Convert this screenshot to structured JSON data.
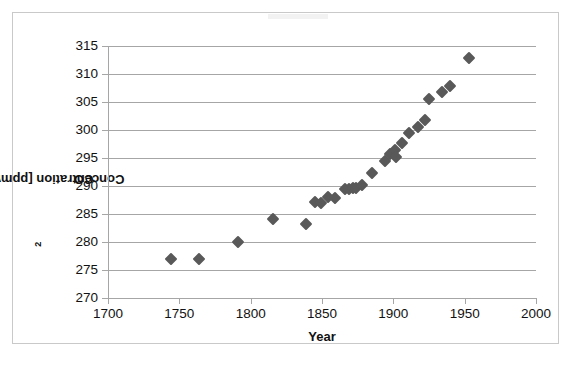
{
  "chart_data": {
    "type": "scatter",
    "title": "",
    "xlabel": "Year",
    "ylabel": "CO² Concentration [ppmv]",
    "ylabel_base": "CO",
    "ylabel_sup": "2",
    "ylabel_rest": " Concentration [ppmv]",
    "xlim": [
      1700,
      2000
    ],
    "ylim": [
      270,
      315
    ],
    "xticks": [
      1700,
      1750,
      1800,
      1850,
      1900,
      1950,
      2000
    ],
    "yticks": [
      270,
      275,
      280,
      285,
      290,
      295,
      300,
      305,
      310,
      315
    ],
    "grid": "horizontal",
    "legend": "none",
    "marker": "diamond",
    "marker_color": "#595959",
    "gridline_color": "#A6A6A6",
    "frame_color": "#C9C9C9",
    "series": [
      {
        "name": "CO2 concentration",
        "points": [
          {
            "x": 1744,
            "y": 277.0
          },
          {
            "x": 1764,
            "y": 276.9
          },
          {
            "x": 1791,
            "y": 280.0
          },
          {
            "x": 1816,
            "y": 284.1
          },
          {
            "x": 1839,
            "y": 283.3
          },
          {
            "x": 1845,
            "y": 287.2
          },
          {
            "x": 1849,
            "y": 287.0
          },
          {
            "x": 1854,
            "y": 288.0
          },
          {
            "x": 1859,
            "y": 287.8
          },
          {
            "x": 1866,
            "y": 289.5
          },
          {
            "x": 1869,
            "y": 289.4
          },
          {
            "x": 1872,
            "y": 289.7
          },
          {
            "x": 1874,
            "y": 289.6
          },
          {
            "x": 1878,
            "y": 290.2
          },
          {
            "x": 1885,
            "y": 292.4
          },
          {
            "x": 1894,
            "y": 294.5
          },
          {
            "x": 1898,
            "y": 295.8
          },
          {
            "x": 1901,
            "y": 296.5
          },
          {
            "x": 1902,
            "y": 295.2
          },
          {
            "x": 1906,
            "y": 297.6
          },
          {
            "x": 1911,
            "y": 299.4
          },
          {
            "x": 1917,
            "y": 300.6
          },
          {
            "x": 1922,
            "y": 301.7
          },
          {
            "x": 1925,
            "y": 305.5
          },
          {
            "x": 1934,
            "y": 306.8
          },
          {
            "x": 1940,
            "y": 307.9
          },
          {
            "x": 1953,
            "y": 312.9
          }
        ]
      }
    ]
  }
}
